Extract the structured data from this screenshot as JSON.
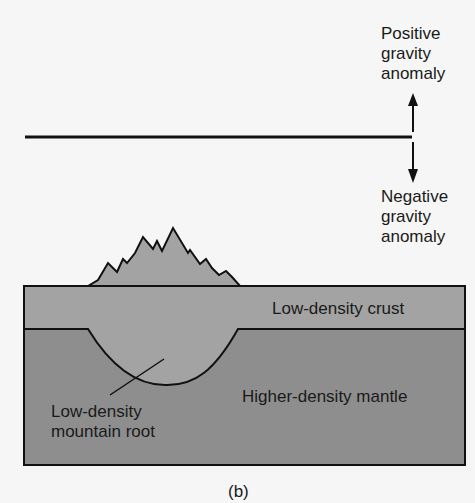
{
  "diagram": {
    "panel_label": "(b)",
    "gravity_profile": {
      "positive_label": [
        "Positive",
        "gravity",
        "anomaly"
      ],
      "negative_label": [
        "Negative",
        "gravity",
        "anomaly"
      ]
    },
    "layers": {
      "crust": "Low-density crust",
      "mantle": "Higher-density mantle",
      "root": [
        "Low-density",
        "mountain root"
      ]
    },
    "colors": {
      "background": "#f6f6f6",
      "crust": "#a3a3a3",
      "mantle": "#8e8e8e",
      "outline": "#111111"
    }
  }
}
